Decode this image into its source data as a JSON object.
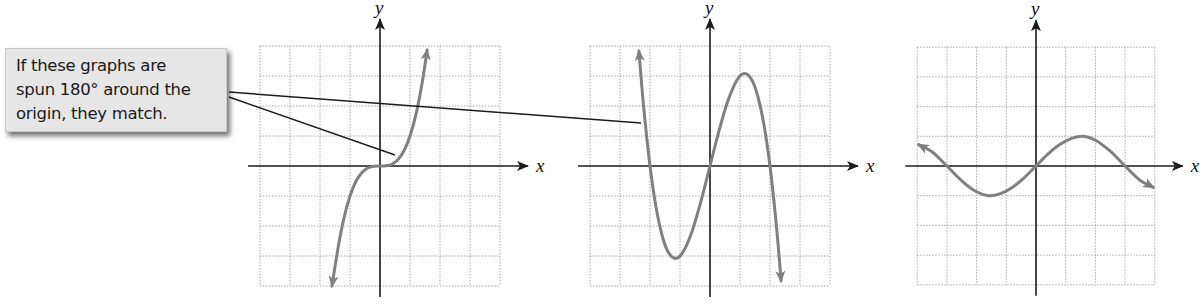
{
  "callout": {
    "lines": [
      "If these graphs are",
      "spun 180° around the",
      "origin, they match."
    ],
    "background": "#e6e6e6"
  },
  "colors": {
    "curve": "#808080",
    "axis": "#1c1c1c",
    "grid": "#a8a8a8",
    "leader": "#1c1c1c"
  },
  "leader_lines": [
    {
      "from": [
        229,
        92
      ],
      "to": [
        641,
        123
      ]
    },
    {
      "from": [
        229,
        97
      ],
      "to": [
        395,
        155
      ]
    }
  ],
  "chart_data": [
    {
      "type": "line",
      "title": "",
      "xlabel": "x",
      "ylabel": "y",
      "xlim": [
        -4,
        4
      ],
      "ylim": [
        -4,
        4
      ],
      "grid": true,
      "grid_step": 1,
      "description": "y = x^3 (odd function, symmetric about origin)",
      "series": [
        {
          "name": "curve",
          "x": [
            -1.6,
            -1.4,
            -1.2,
            -1.0,
            -0.8,
            -0.6,
            -0.4,
            -0.2,
            0,
            0.2,
            0.4,
            0.6,
            0.8,
            1.0,
            1.2,
            1.4,
            1.57
          ],
          "y": [
            -4.0,
            -2.74,
            -1.73,
            -1.0,
            -0.51,
            -0.22,
            -0.06,
            -0.01,
            0,
            0.01,
            0.06,
            0.22,
            0.51,
            1.0,
            1.73,
            2.74,
            3.87
          ]
        }
      ],
      "arrows": "both ends",
      "layout": {
        "origin_px": [
          380,
          166
        ],
        "cell_px": 30
      }
    },
    {
      "type": "line",
      "title": "",
      "xlabel": "x",
      "ylabel": "y",
      "xlim": [
        -4,
        4
      ],
      "ylim": [
        -4,
        4
      ],
      "grid": true,
      "grid_step": 1,
      "description": "y = -x^3 + 4x, zeros at -2, 0, 2; local max ≈ (1.15, 3.08), local min ≈ (-1.15, -3.08)",
      "series": [
        {
          "name": "curve",
          "x": [
            -2.37,
            -2.2,
            -2.0,
            -1.8,
            -1.6,
            -1.4,
            -1.15,
            -0.9,
            -0.6,
            -0.3,
            0,
            0.3,
            0.6,
            0.9,
            1.15,
            1.4,
            1.6,
            1.8,
            2.0,
            2.2,
            2.37
          ],
          "y": [
            3.83,
            1.85,
            0,
            -1.37,
            -2.3,
            -2.86,
            -3.08,
            -2.87,
            -2.18,
            -1.17,
            0,
            1.17,
            2.18,
            2.87,
            3.08,
            2.86,
            2.3,
            1.37,
            0,
            -1.85,
            -3.83
          ]
        }
      ],
      "arrows": "both ends",
      "layout": {
        "origin_px": [
          710,
          166
        ],
        "cell_px": 30
      }
    },
    {
      "type": "line",
      "title": "",
      "xlabel": "x",
      "ylabel": "y",
      "xlim": [
        -4,
        4
      ],
      "ylim": [
        -4,
        4
      ],
      "grid": true,
      "grid_step": 1,
      "description": "odd cubic-like wave, zeros at -3, 0, 3; local max ≈ (1.6, 1), local min ≈ (-1.6, -1)",
      "series": [
        {
          "name": "curve",
          "x": [
            -3.95,
            -3.5,
            -3.0,
            -2.5,
            -2.0,
            -1.6,
            -1.2,
            -0.8,
            -0.4,
            0,
            0.4,
            0.8,
            1.2,
            1.6,
            2.0,
            2.5,
            3.0,
            3.5,
            3.95
          ],
          "y": [
            0.72,
            0.48,
            0,
            -0.5,
            -0.87,
            -1.0,
            -0.93,
            -0.72,
            -0.4,
            0,
            0.4,
            0.72,
            0.93,
            1.0,
            0.87,
            0.5,
            0,
            -0.48,
            -0.72
          ]
        }
      ],
      "arrows": "both ends",
      "layout": {
        "origin_px": [
          1036,
          166
        ],
        "cell_px": 29.7
      }
    }
  ]
}
